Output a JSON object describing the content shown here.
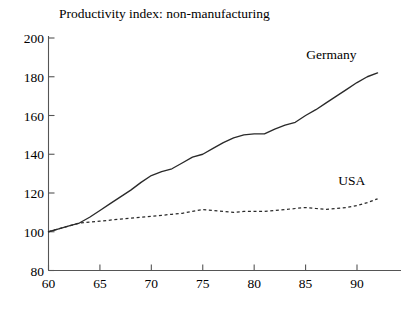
{
  "chart_data": {
    "type": "line",
    "title": "Productivity index: non-manufacturing",
    "xlabel": "",
    "ylabel": "",
    "xlim": [
      60,
      93
    ],
    "ylim": [
      80,
      200
    ],
    "xticks": [
      60,
      65,
      70,
      75,
      80,
      85,
      90
    ],
    "yticks": [
      80,
      100,
      120,
      140,
      160,
      180,
      200
    ],
    "xtick_labels": [
      "60",
      "65",
      "70",
      "75",
      "80",
      "85",
      "90"
    ],
    "ytick_labels": [
      "80",
      "100",
      "120",
      "140",
      "160",
      "180",
      "200"
    ],
    "grid": false,
    "legend": "inline-labels",
    "x": [
      60,
      61,
      62,
      63,
      64,
      65,
      66,
      67,
      68,
      69,
      70,
      71,
      72,
      73,
      74,
      75,
      76,
      77,
      78,
      79,
      80,
      81,
      82,
      83,
      84,
      85,
      86,
      87,
      88,
      89,
      90,
      91,
      92
    ],
    "series": [
      {
        "name": "Germany",
        "style": "solid",
        "label_x": 87.5,
        "label_y": 189,
        "values": [
          100,
          101.5,
          103,
          104.5,
          107.5,
          111,
          114.5,
          118,
          121.5,
          125.5,
          129,
          131,
          132.5,
          135.5,
          138.5,
          140,
          143,
          146,
          148.5,
          150,
          150.5,
          150.5,
          153,
          155,
          156.5,
          160,
          163,
          166.5,
          170,
          173.5,
          177,
          180,
          182
        ]
      },
      {
        "name": "USA",
        "style": "dashed",
        "label_x": 89.5,
        "label_y": 124,
        "values": [
          100,
          101.5,
          103,
          104.5,
          105,
          105.5,
          106,
          106.5,
          107,
          107.5,
          108,
          108.5,
          109,
          109.5,
          110.5,
          111.5,
          111,
          110.5,
          110,
          110.5,
          110.5,
          110.5,
          111,
          111.5,
          112,
          112.5,
          112,
          111.5,
          112,
          112.5,
          113.5,
          115,
          117
        ]
      }
    ]
  }
}
